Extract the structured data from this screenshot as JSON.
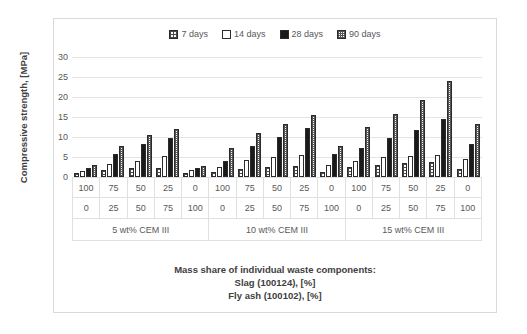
{
  "chart_data": {
    "type": "bar",
    "title": "",
    "xlabel": "Mass share of individual waste components:",
    "xlabel_line2": "Slag (100124),   [%]",
    "xlabel_line3": "Fly ash (100102),   [%]",
    "ylabel": "Compressive strength, [MPa]",
    "ylim": [
      0,
      30
    ],
    "yticks": [
      30,
      25,
      20,
      15,
      10,
      5,
      0
    ],
    "grid": true,
    "legend_position": "top",
    "categories": [
      "100/0",
      "75/25",
      "50/50",
      "25/75",
      "0/100",
      "100/0",
      "75/25",
      "50/50",
      "25/75",
      "0/100",
      "100/0",
      "75/25",
      "50/50",
      "25/75",
      "0/100"
    ],
    "row_headers": [
      "Slag (100124),   [%]",
      "Fly ash (100102),   [%]"
    ],
    "slag_values": [
      "100",
      "75",
      "50",
      "25",
      "0",
      "100",
      "75",
      "50",
      "25",
      "0",
      "100",
      "75",
      "50",
      "25",
      "0"
    ],
    "flyash_values": [
      "0",
      "25",
      "50",
      "75",
      "100",
      "0",
      "25",
      "50",
      "75",
      "100",
      "0",
      "25",
      "50",
      "75",
      "100"
    ],
    "groups": [
      {
        "label": "5 wt% CEM III",
        "span": 5
      },
      {
        "label": "10 wt% CEM III",
        "span": 5
      },
      {
        "label": "15 wt% CEM III",
        "span": 5
      }
    ],
    "series": [
      {
        "name": "7 days",
        "pattern": "checker-light",
        "values": [
          1.0,
          1.7,
          2.2,
          2.3,
          1.0,
          1.3,
          2.0,
          2.6,
          2.8,
          1.2,
          2.4,
          3.1,
          3.6,
          3.7,
          2.0
        ]
      },
      {
        "name": "14 days",
        "pattern": "white-outline",
        "values": [
          1.6,
          3.3,
          4.0,
          5.2,
          1.8,
          2.4,
          4.3,
          5.1,
          5.6,
          2.9,
          4.1,
          4.9,
          5.2,
          5.5,
          4.5
        ]
      },
      {
        "name": "28 days",
        "pattern": "solid-black",
        "values": [
          2.3,
          5.8,
          8.2,
          9.8,
          2.2,
          3.9,
          7.8,
          10.0,
          12.2,
          5.7,
          7.2,
          9.8,
          11.7,
          14.5,
          8.2
        ]
      },
      {
        "name": "90 days",
        "pattern": "checker-fine",
        "values": [
          3.0,
          7.8,
          10.4,
          12.0,
          2.8,
          7.3,
          11.0,
          13.2,
          15.5,
          7.8,
          12.5,
          15.8,
          19.2,
          24.1,
          13.2
        ]
      }
    ]
  },
  "legend": {
    "items": [
      {
        "label": "7 days"
      },
      {
        "label": "14 days"
      },
      {
        "label": "28 days"
      },
      {
        "label": "90 days"
      }
    ]
  },
  "colors": {
    "series_28_days": "#1a1a1a",
    "grid": "#e4e4e4",
    "text": "#595959",
    "frame": "#d9d9d9"
  }
}
